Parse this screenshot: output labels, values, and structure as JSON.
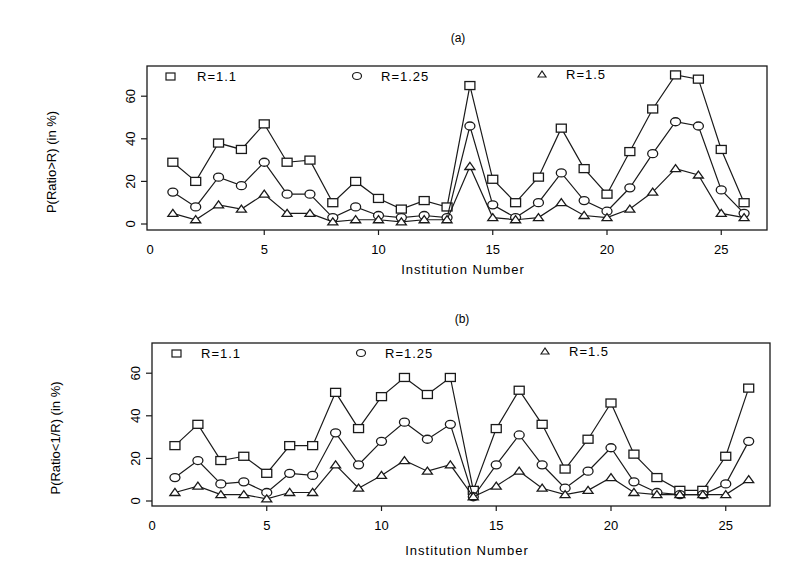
{
  "chart_data": [
    {
      "type": "line",
      "panel": "(a)",
      "title": "(a)",
      "xlabel": "Institution Number",
      "ylabel": "P(Ratio>R) (in %)",
      "xlim": [
        0,
        26
      ],
      "ylim": [
        0,
        70
      ],
      "xticks": [
        0,
        5,
        10,
        15,
        20,
        25
      ],
      "yticks": [
        0,
        20,
        40,
        60
      ],
      "grid": false,
      "legend_position": "top inside",
      "x": [
        1,
        2,
        3,
        4,
        5,
        6,
        7,
        8,
        9,
        10,
        11,
        12,
        13,
        14,
        15,
        16,
        17,
        18,
        19,
        20,
        21,
        22,
        23,
        24,
        25,
        26
      ],
      "series": [
        {
          "name": "R=1.1",
          "marker": "square",
          "values": [
            29,
            20,
            38,
            35,
            47,
            29,
            30,
            10,
            20,
            12,
            7,
            11,
            8,
            65,
            21,
            10,
            22,
            45,
            26,
            14,
            34,
            54,
            70,
            68,
            35,
            10
          ]
        },
        {
          "name": "R=1.25",
          "marker": "circle",
          "values": [
            15,
            8,
            22,
            18,
            29,
            14,
            14,
            3,
            8,
            4,
            3,
            4,
            3,
            46,
            9,
            3,
            10,
            24,
            11,
            6,
            17,
            33,
            48,
            46,
            16,
            5
          ]
        },
        {
          "name": "R=1.5",
          "marker": "triangle",
          "values": [
            5,
            2,
            9,
            7,
            14,
            5,
            5,
            1,
            2,
            2,
            1,
            2,
            2,
            27,
            3,
            2,
            3,
            10,
            4,
            3,
            7,
            15,
            26,
            23,
            5,
            3
          ]
        }
      ]
    },
    {
      "type": "line",
      "panel": "(b)",
      "title": "(b)",
      "xlabel": "Institution Number",
      "ylabel": "P(Ratio<1/R) (in %)",
      "xlim": [
        0,
        26
      ],
      "ylim": [
        0,
        70
      ],
      "xticks": [
        0,
        5,
        10,
        15,
        20,
        25
      ],
      "yticks": [
        0,
        20,
        40,
        60
      ],
      "grid": false,
      "legend_position": "top inside",
      "x": [
        1,
        2,
        3,
        4,
        5,
        6,
        7,
        8,
        9,
        10,
        11,
        12,
        13,
        14,
        15,
        16,
        17,
        18,
        19,
        20,
        21,
        22,
        23,
        24,
        25,
        26
      ],
      "series": [
        {
          "name": "R=1.1",
          "marker": "square",
          "values": [
            26,
            36,
            19,
            21,
            13,
            26,
            26,
            51,
            34,
            49,
            58,
            50,
            58,
            5,
            34,
            52,
            36,
            15,
            29,
            46,
            22,
            11,
            5,
            5,
            21,
            53
          ]
        },
        {
          "name": "R=1.25",
          "marker": "circle",
          "values": [
            11,
            19,
            8,
            9,
            4,
            13,
            12,
            32,
            17,
            28,
            37,
            29,
            36,
            2,
            17,
            31,
            17,
            6,
            14,
            25,
            9,
            4,
            3,
            3,
            8,
            28
          ]
        },
        {
          "name": "R=1.5",
          "marker": "triangle",
          "values": [
            4,
            7,
            3,
            3,
            1,
            4,
            4,
            17,
            6,
            12,
            19,
            14,
            17,
            2,
            7,
            14,
            6,
            3,
            5,
            11,
            4,
            3,
            3,
            3,
            3,
            10
          ]
        }
      ]
    }
  ],
  "panels": {
    "a": {
      "title": "(a)",
      "xlabel": "Institution Number",
      "ylabel": "P(Ratio>R) (in %)",
      "legend": [
        "R=1.1",
        "R=1.25",
        "R=1.5"
      ]
    },
    "b": {
      "title": "(b)",
      "xlabel": "Institution Number",
      "ylabel": "P(Ratio<1/R) (in %)",
      "legend": [
        "R=1.1",
        "R=1.25",
        "R=1.5"
      ]
    }
  },
  "colors": {
    "ink": "#1a1a1a",
    "background": "#ffffff"
  }
}
